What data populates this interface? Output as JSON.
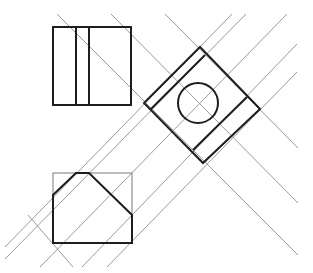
{
  "diagram": {
    "type": "orthographic-projection",
    "colors": {
      "background": "#ffffff",
      "object_line": "#1e1e1e",
      "construction_line": "#9a9a9a",
      "frame_line": "#7a7a7a"
    },
    "views": {
      "top_view": {
        "outline": {
          "x": 53,
          "y": 27,
          "width": 78,
          "height": 78
        },
        "inner_vertical_lines_x": [
          76,
          89
        ]
      },
      "rotated_auxiliary_view": {
        "square_vertices": [
          [
            200,
            47
          ],
          [
            260,
            109
          ],
          [
            203,
            163
          ],
          [
            144,
            103
          ]
        ],
        "circle": {
          "cx": 198,
          "cy": 103,
          "r": 20
        },
        "inner_lines": [
          [
            [
              205,
              55
            ],
            [
              150,
              110
            ]
          ],
          [
            [
              247,
              97
            ],
            [
              193,
              150
            ]
          ]
        ]
      },
      "bottom_view": {
        "frame": {
          "x": 53,
          "y": 173,
          "width": 79,
          "height": 70
        },
        "profile_polygon": [
          [
            53,
            195
          ],
          [
            76,
            173
          ],
          [
            89,
            173
          ],
          [
            132,
            215
          ],
          [
            132,
            243
          ],
          [
            53,
            243
          ]
        ]
      }
    },
    "construction_lines": [
      [
        [
          57,
          14
        ],
        [
          298,
          255
        ]
      ],
      [
        [
          111,
          14
        ],
        [
          298,
          203
        ]
      ],
      [
        [
          165,
          14
        ],
        [
          298,
          148
        ]
      ],
      [
        [
          28,
          215
        ],
        [
          73,
          267
        ]
      ],
      [
        [
          232,
          14
        ],
        [
          5,
          247
        ]
      ],
      [
        [
          246,
          14
        ],
        [
          5,
          259
        ]
      ],
      [
        [
          287,
          14
        ],
        [
          40,
          267
        ]
      ],
      [
        [
          297,
          44
        ],
        [
          82,
          267
        ]
      ],
      [
        [
          297,
          72
        ],
        [
          107,
          267
        ]
      ]
    ]
  }
}
